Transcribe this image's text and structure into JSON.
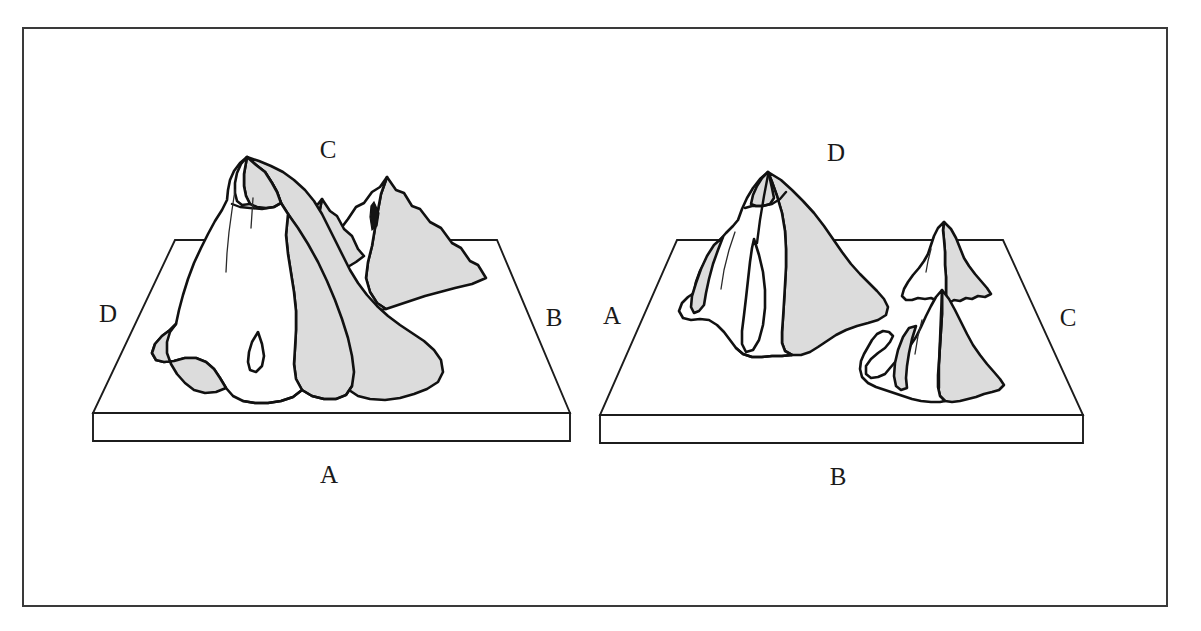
{
  "figure": {
    "border_color": "#3a3a3a",
    "background_color": "#ffffff",
    "shade_color": "#dcdcdc",
    "line_color": "#111111"
  },
  "panels": [
    {
      "id": "left-panel",
      "name": "left-block-diagram",
      "labels": {
        "top": "C",
        "left": "D",
        "right": "B",
        "bottom": "A"
      },
      "peak_count": 3,
      "description": "Block of terrain with one tall central peak, a small middle peak and a secondary right peak"
    },
    {
      "id": "right-panel",
      "name": "right-block-diagram",
      "labels": {
        "top": "D",
        "left": "A",
        "right": "C",
        "bottom": "B"
      },
      "peak_count": 3,
      "description": "Block of terrain with one broad left peak and two smaller peaks on the right"
    }
  ]
}
